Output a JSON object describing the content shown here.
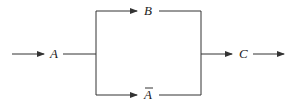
{
  "diagram": {
    "type": "flow-block",
    "nodes": {
      "input": {
        "label": "A"
      },
      "top_branch": {
        "label": "B"
      },
      "bottom_branch": {
        "label": "A",
        "overbar": true,
        "meaning": "not A"
      },
      "output": {
        "label": "C"
      }
    },
    "edges": [
      {
        "from": "start",
        "to": "input"
      },
      {
        "from": "input",
        "to": "top_branch"
      },
      {
        "from": "input",
        "to": "bottom_branch"
      },
      {
        "from": "top_branch",
        "to": "output"
      },
      {
        "from": "bottom_branch",
        "to": "output"
      },
      {
        "from": "output",
        "to": "end"
      }
    ],
    "line_color": "#333333"
  }
}
